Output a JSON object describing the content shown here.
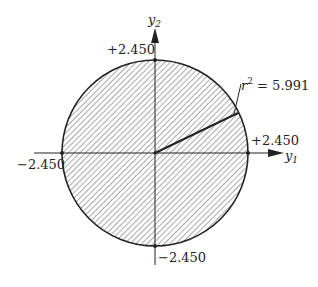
{
  "diagram": {
    "axes": {
      "x_label": "y",
      "x_sub": "1",
      "y_label": "y",
      "y_sub": "2"
    },
    "ticks": {
      "top": "+2.450",
      "right": "+2.450",
      "left": "−2.450",
      "bottom": "−2.450"
    },
    "annotation": {
      "r": "r",
      "sup": "2",
      "rest": " = 5.991"
    },
    "colors": {
      "ink": "#222222",
      "hatch": "#444444",
      "background": "#ffffff"
    }
  }
}
